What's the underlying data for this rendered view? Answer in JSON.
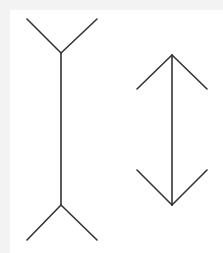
{
  "diagram": {
    "title": "",
    "stroke_color": "#333333",
    "background_color": "#ffffff",
    "frame_color": "#f3f3f3",
    "figures": [
      {
        "id": "left-figure",
        "type": "fins-out",
        "shaft": {
          "x": 61,
          "y1": 53,
          "y2": 205
        },
        "top_fins": [
          [
            27,
            19
          ],
          [
            97,
            19
          ]
        ],
        "bottom_fins": [
          [
            27,
            240
          ],
          [
            97,
            240
          ]
        ]
      },
      {
        "id": "right-figure",
        "type": "arrows-in",
        "shaft": {
          "x": 172,
          "y1": 55,
          "y2": 205
        },
        "top_fins": [
          [
            137,
            89
          ],
          [
            207,
            89
          ]
        ],
        "bottom_fins": [
          [
            137,
            170
          ],
          [
            207,
            170
          ]
        ]
      }
    ]
  }
}
